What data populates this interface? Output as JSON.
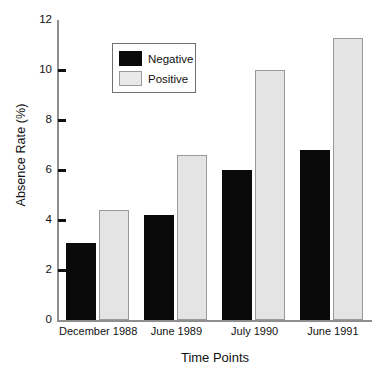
{
  "chart_data": {
    "type": "bar",
    "title": "",
    "xlabel": "Time Points",
    "ylabel": "Absence Rate (%)",
    "categories": [
      "December 1988",
      "June 1989",
      "July 1990",
      "June 1991"
    ],
    "series": [
      {
        "name": "Negative",
        "color": "#0a0a0a",
        "values": [
          3.1,
          4.2,
          6.0,
          6.8
        ]
      },
      {
        "name": "Positive",
        "color": "#e4e4e4",
        "values": [
          4.4,
          6.6,
          10.0,
          11.3
        ]
      }
    ],
    "ylim": [
      0,
      12
    ],
    "yticks": [
      0,
      2,
      4,
      6,
      8,
      10,
      12
    ],
    "ytick_labels": [
      "0",
      "2",
      "4",
      "6",
      "8",
      "10",
      "12"
    ],
    "grid": false,
    "legend_position": "upper-left-inside"
  },
  "legend": {
    "items": [
      {
        "label": "Negative"
      },
      {
        "label": "Positive"
      }
    ]
  }
}
